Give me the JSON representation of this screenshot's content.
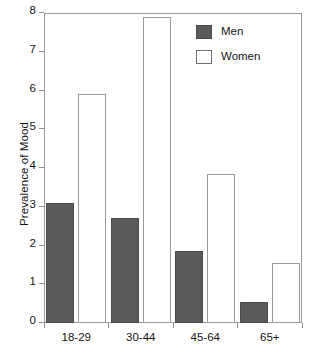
{
  "chart_data": {
    "type": "bar",
    "title": "",
    "subtitle": "",
    "xlabel": "",
    "ylabel": "Prevalence of Mood",
    "categories": [
      "18-29",
      "30-44",
      "45-64",
      "65+"
    ],
    "series": [
      {
        "name": "Men",
        "color": "#5a5a5a",
        "values": [
          3.1,
          2.7,
          1.85,
          0.55
        ]
      },
      {
        "name": "Women",
        "color": "#ffffff",
        "values": [
          5.9,
          7.9,
          3.85,
          1.55
        ]
      }
    ],
    "ylim": [
      0,
      8
    ],
    "yticks": [
      0,
      1,
      2,
      3,
      4,
      5,
      6,
      7,
      8
    ],
    "ytick_labels": [
      "0",
      "1",
      "2",
      "3",
      "4",
      "5",
      "6",
      "7",
      "8"
    ],
    "grid": false,
    "legend_position": "top-right",
    "legend_entries": [
      "Men",
      "Women"
    ]
  }
}
